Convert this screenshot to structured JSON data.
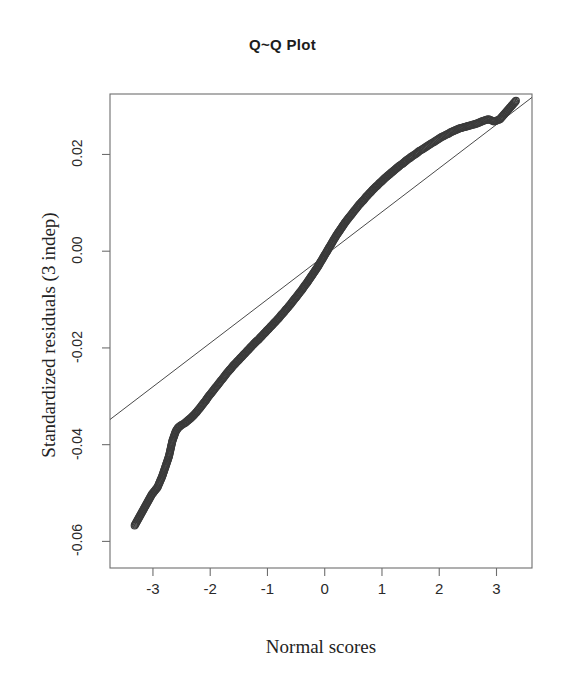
{
  "chart_data": {
    "type": "scatter",
    "title": "Q~Q Plot",
    "xlabel": "Normal scores",
    "ylabel": "Standardized residuals (3 indep)",
    "xlim": [
      -3.75,
      3.62
    ],
    "ylim": [
      -0.0655,
      0.0325
    ],
    "xticks": [
      -3,
      -2,
      -1,
      0,
      1,
      2,
      3
    ],
    "xtick_labels": [
      "-3",
      "-2",
      "-1",
      "0",
      "1",
      "2",
      "3"
    ],
    "yticks": [
      0.02,
      0.0,
      -0.02,
      -0.04,
      -0.06
    ],
    "ytick_labels": [
      "0.02",
      "0.00",
      "-0.02",
      "-0.04",
      "-0.06"
    ],
    "grid": false,
    "legend": null,
    "point_style": "open-circle",
    "point_color": "#3b3b3b",
    "point_radius": 3.4,
    "line_color": "#4a4a4a",
    "box_color": "#6e6e6e",
    "reference_line": {
      "name": "qqline",
      "x": [
        -3.75,
        3.62
      ],
      "y": [
        -0.0348,
        0.0318
      ]
    },
    "series": [
      {
        "name": "Standardized residuals (3 indep)",
        "points": [
          [
            -3.32,
            -0.0567
          ],
          [
            -3.02,
            -0.0503
          ],
          [
            -2.92,
            -0.0488
          ],
          [
            -2.84,
            -0.0466
          ],
          [
            -2.72,
            -0.0424
          ],
          [
            -2.66,
            -0.0392
          ],
          [
            -2.6,
            -0.0372
          ],
          [
            -2.56,
            -0.0365
          ],
          [
            -2.52,
            -0.0361
          ],
          [
            -2.48,
            -0.0358
          ],
          [
            -2.44,
            -0.0355
          ],
          [
            -2.4,
            -0.0351
          ],
          [
            -2.36,
            -0.0347
          ],
          [
            -2.32,
            -0.0343
          ],
          [
            -2.28,
            -0.0338
          ],
          [
            -2.24,
            -0.0333
          ],
          [
            -2.2,
            -0.0327
          ],
          [
            -2.16,
            -0.0321
          ],
          [
            -2.12,
            -0.0315
          ],
          [
            -2.08,
            -0.0309
          ],
          [
            -2.04,
            -0.0302
          ],
          [
            -2.0,
            -0.0296
          ],
          [
            -1.96,
            -0.029
          ],
          [
            -1.92,
            -0.0284
          ],
          [
            -1.88,
            -0.0278
          ],
          [
            -1.84,
            -0.0272
          ],
          [
            -1.8,
            -0.0266
          ],
          [
            -1.76,
            -0.026
          ],
          [
            -1.72,
            -0.0254
          ],
          [
            -1.68,
            -0.0248
          ],
          [
            -1.64,
            -0.0243
          ],
          [
            -1.6,
            -0.0237
          ],
          [
            -1.56,
            -0.0232
          ],
          [
            -1.52,
            -0.0227
          ],
          [
            -1.48,
            -0.0222
          ],
          [
            -1.44,
            -0.0217
          ],
          [
            -1.4,
            -0.0212
          ],
          [
            -1.36,
            -0.0207
          ],
          [
            -1.32,
            -0.0202
          ],
          [
            -1.28,
            -0.0197
          ],
          [
            -1.24,
            -0.0192
          ],
          [
            -1.2,
            -0.0187
          ],
          [
            -1.16,
            -0.0183
          ],
          [
            -1.12,
            -0.0178
          ],
          [
            -1.08,
            -0.0173
          ],
          [
            -1.04,
            -0.0168
          ],
          [
            -1.0,
            -0.0163
          ],
          [
            -0.96,
            -0.0158
          ],
          [
            -0.92,
            -0.0153
          ],
          [
            -0.88,
            -0.0148
          ],
          [
            -0.84,
            -0.0143
          ],
          [
            -0.8,
            -0.0138
          ],
          [
            -0.76,
            -0.0132
          ],
          [
            -0.72,
            -0.0127
          ],
          [
            -0.68,
            -0.0121
          ],
          [
            -0.64,
            -0.0116
          ],
          [
            -0.6,
            -0.011
          ],
          [
            -0.56,
            -0.0104
          ],
          [
            -0.52,
            -0.0098
          ],
          [
            -0.48,
            -0.0092
          ],
          [
            -0.44,
            -0.0086
          ],
          [
            -0.4,
            -0.008
          ],
          [
            -0.36,
            -0.0073
          ],
          [
            -0.32,
            -0.0067
          ],
          [
            -0.28,
            -0.006
          ],
          [
            -0.24,
            -0.0053
          ],
          [
            -0.2,
            -0.0046
          ],
          [
            -0.16,
            -0.0039
          ],
          [
            -0.12,
            -0.0032
          ],
          [
            -0.08,
            -0.0024
          ],
          [
            -0.04,
            -0.0016
          ],
          [
            0.0,
            -0.0008
          ],
          [
            0.04,
            0.0
          ],
          [
            0.08,
            0.0008
          ],
          [
            0.12,
            0.0016
          ],
          [
            0.16,
            0.0024
          ],
          [
            0.2,
            0.0032
          ],
          [
            0.24,
            0.0039
          ],
          [
            0.28,
            0.0046
          ],
          [
            0.32,
            0.0053
          ],
          [
            0.36,
            0.006
          ],
          [
            0.4,
            0.0066
          ],
          [
            0.44,
            0.0072
          ],
          [
            0.48,
            0.0078
          ],
          [
            0.52,
            0.0084
          ],
          [
            0.56,
            0.009
          ],
          [
            0.6,
            0.0096
          ],
          [
            0.64,
            0.0101
          ],
          [
            0.68,
            0.0106
          ],
          [
            0.72,
            0.0112
          ],
          [
            0.76,
            0.0117
          ],
          [
            0.8,
            0.0122
          ],
          [
            0.84,
            0.0127
          ],
          [
            0.88,
            0.0132
          ],
          [
            0.92,
            0.0136
          ],
          [
            0.96,
            0.0141
          ],
          [
            1.0,
            0.0145
          ],
          [
            1.04,
            0.015
          ],
          [
            1.08,
            0.0154
          ],
          [
            1.12,
            0.0158
          ],
          [
            1.16,
            0.0162
          ],
          [
            1.2,
            0.0166
          ],
          [
            1.24,
            0.017
          ],
          [
            1.28,
            0.0174
          ],
          [
            1.32,
            0.0178
          ],
          [
            1.36,
            0.0181
          ],
          [
            1.4,
            0.0185
          ],
          [
            1.44,
            0.0189
          ],
          [
            1.48,
            0.0192
          ],
          [
            1.52,
            0.0196
          ],
          [
            1.56,
            0.0199
          ],
          [
            1.6,
            0.0202
          ],
          [
            1.64,
            0.0206
          ],
          [
            1.68,
            0.0209
          ],
          [
            1.72,
            0.0212
          ],
          [
            1.76,
            0.0215
          ],
          [
            1.8,
            0.0218
          ],
          [
            1.84,
            0.0221
          ],
          [
            1.88,
            0.0224
          ],
          [
            1.92,
            0.0227
          ],
          [
            1.96,
            0.023
          ],
          [
            2.0,
            0.0233
          ],
          [
            2.04,
            0.0236
          ],
          [
            2.08,
            0.0238
          ],
          [
            2.12,
            0.0241
          ],
          [
            2.16,
            0.0243
          ],
          [
            2.2,
            0.0246
          ],
          [
            2.24,
            0.0248
          ],
          [
            2.28,
            0.025
          ],
          [
            2.32,
            0.0252
          ],
          [
            2.36,
            0.0254
          ],
          [
            2.42,
            0.0256
          ],
          [
            2.48,
            0.0258
          ],
          [
            2.54,
            0.026
          ],
          [
            2.6,
            0.0262
          ],
          [
            2.66,
            0.0264
          ],
          [
            2.72,
            0.0267
          ],
          [
            2.78,
            0.027
          ],
          [
            2.86,
            0.0273
          ],
          [
            2.96,
            0.0268
          ],
          [
            3.06,
            0.0273
          ],
          [
            3.34,
            0.0311
          ]
        ]
      }
    ]
  },
  "axis": {
    "y_labels": [
      "0.02",
      "0.00",
      "-0.02",
      "-0.04",
      "-0.06"
    ],
    "x_labels": [
      "-3",
      "-2",
      "-1",
      "0",
      "1",
      "2",
      "3"
    ]
  }
}
